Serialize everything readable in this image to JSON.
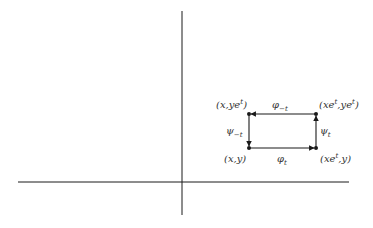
{
  "diagram": {
    "type": "commutative-flow-rectangle",
    "colors": {
      "axis": "#1a1a1a",
      "edge": "#1a1a1a",
      "text": "#333333",
      "background": "#ffffff"
    },
    "axes": {
      "horizontal": {
        "x1": 18,
        "y": 182,
        "x2": 349
      },
      "vertical": {
        "x": 182,
        "y1": 11,
        "y2": 215
      }
    },
    "corners": {
      "top_left": {
        "label": "(x,ye",
        "sup": "t",
        "tail": ")"
      },
      "top_right": {
        "label": "(xe",
        "sup": "t",
        "mid": ",ye",
        "sup2": "t",
        "tail": ")"
      },
      "bottom_left": {
        "label": "(x,y)"
      },
      "bottom_right": {
        "label": "(xe",
        "sup": "t",
        "tail": ",y)"
      }
    },
    "edges": {
      "top": {
        "label": "φ",
        "sub": "−t",
        "direction": "right-to-left"
      },
      "right": {
        "label": "ψ",
        "sub": "t",
        "direction": "bottom-to-top"
      },
      "left": {
        "label": "ψ",
        "sub": "−t",
        "direction": "top-to-bottom"
      },
      "bottom": {
        "label": "φ",
        "sub": "t",
        "direction": "left-to-right"
      }
    }
  }
}
